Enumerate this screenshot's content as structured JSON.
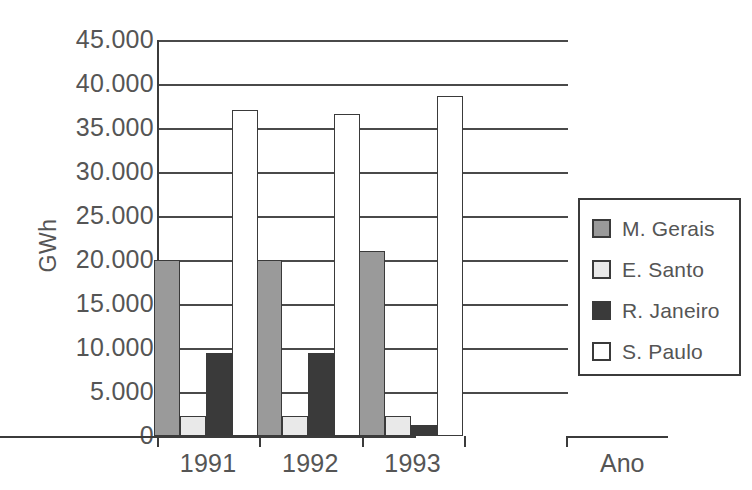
{
  "chart_data": {
    "type": "bar",
    "title": "",
    "xlabel": "Ano",
    "ylabel": "GWh",
    "categories": [
      "1991",
      "1992",
      "1993"
    ],
    "ylim": [
      0,
      45000
    ],
    "ytick_values": [
      0,
      5000,
      10000,
      15000,
      20000,
      25000,
      30000,
      35000,
      40000,
      45000
    ],
    "ytick_labels": [
      "0",
      "5.000",
      "10.000",
      "15.000",
      "20.000",
      "25.000",
      "30.000",
      "35.000",
      "40.000",
      "45.000"
    ],
    "grid": true,
    "legend_position": "right",
    "series": [
      {
        "name": "M. Gerais",
        "color": "#9a9a9a",
        "values": [
          20000,
          20000,
          21000
        ]
      },
      {
        "name": "E. Santo",
        "color": "#e9e9e9",
        "values": [
          2300,
          2300,
          2300
        ]
      },
      {
        "name": "R. Janeiro",
        "color": "#3a3a3a",
        "values": [
          9400,
          9400,
          1200
        ]
      },
      {
        "name": "S. Paulo",
        "color": "#ffffff",
        "values": [
          37100,
          36600,
          38600
        ]
      }
    ]
  },
  "axes": {
    "y_title": "GWh",
    "x_title": "Ano",
    "y_ticks": [
      {
        "label": "45.000",
        "value": 45000
      },
      {
        "label": "40.000",
        "value": 40000
      },
      {
        "label": "35.000",
        "value": 35000
      },
      {
        "label": "30.000",
        "value": 30000
      },
      {
        "label": "25.000",
        "value": 25000
      },
      {
        "label": "20.000",
        "value": 20000
      },
      {
        "label": "15.000",
        "value": 15000
      },
      {
        "label": "10.000",
        "value": 10000
      },
      {
        "label": "5.000",
        "value": 5000
      },
      {
        "label": "0",
        "value": 0
      }
    ],
    "x_ticks": [
      "1991",
      "1992",
      "1993"
    ]
  },
  "legend": {
    "items": [
      {
        "label": "M. Gerais",
        "color": "#9a9a9a"
      },
      {
        "label": "E. Santo",
        "color": "#e9e9e9"
      },
      {
        "label": "R. Janeiro",
        "color": "#3a3a3a"
      },
      {
        "label": "S. Paulo",
        "color": "#ffffff"
      }
    ]
  },
  "style": {
    "line_color": "#3b3b3b",
    "text_color": "#555555",
    "background": "#ffffff"
  }
}
